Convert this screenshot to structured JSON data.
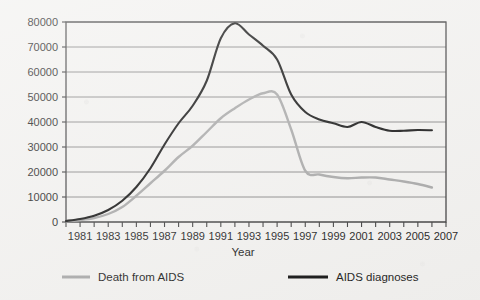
{
  "chart_data": {
    "type": "line",
    "title": "",
    "subtitle": "",
    "xlabel": "Year",
    "ylabel": "",
    "xlim": [
      1980,
      2007
    ],
    "ylim": [
      0,
      80000
    ],
    "grid": "horizontal",
    "legend_position": "bottom",
    "y_ticks": [
      0,
      10000,
      20000,
      30000,
      40000,
      50000,
      60000,
      70000,
      80000
    ],
    "y_tick_labels": [
      "0",
      "10000",
      "20000",
      "30000",
      "40000",
      "50000",
      "60000",
      "70000",
      "80000"
    ],
    "x_ticks": [
      1980,
      1981,
      1982,
      1983,
      1984,
      1985,
      1986,
      1987,
      1988,
      1989,
      1990,
      1991,
      1992,
      1993,
      1994,
      1995,
      1996,
      1997,
      1998,
      1999,
      2000,
      2001,
      2002,
      2003,
      2004,
      2005,
      2006,
      2007
    ],
    "x_tick_labels": [
      "1981",
      "1983",
      "1985",
      "1987",
      "1989",
      "1991",
      "1993",
      "1995",
      "1997",
      "1999",
      "2001",
      "2003",
      "2005",
      "2007"
    ],
    "x_labeled_years": [
      1981,
      1983,
      1985,
      1987,
      1989,
      1991,
      1993,
      1995,
      1997,
      1999,
      2001,
      2003,
      2005,
      2007
    ],
    "x": [
      1980,
      1981,
      1982,
      1983,
      1984,
      1985,
      1986,
      1987,
      1988,
      1989,
      1990,
      1991,
      1992,
      1993,
      1994,
      1995,
      1996,
      1997,
      1998,
      1999,
      2000,
      2001,
      2002,
      2003,
      2004,
      2005,
      2006
    ],
    "series": [
      {
        "name": "AIDS diagnoses",
        "color": "#111111",
        "values": [
          400,
          1200,
          2500,
          4800,
          8500,
          14000,
          21500,
          31000,
          39500,
          46500,
          56500,
          73500,
          79500,
          75000,
          70500,
          65000,
          51000,
          44000,
          41000,
          39500,
          38000,
          40000,
          38000,
          36500,
          36500,
          36800,
          36700
        ]
      },
      {
        "name": "Death from AIDS",
        "color": "#a6a6a6",
        "values": [
          300,
          800,
          1600,
          3200,
          6000,
          10500,
          15500,
          20500,
          26000,
          30500,
          36000,
          41500,
          45500,
          49000,
          51500,
          51000,
          37000,
          20500,
          19000,
          18000,
          17500,
          17800,
          17800,
          17000,
          16200,
          15200,
          13800
        ]
      }
    ],
    "legend": [
      {
        "label": "Death from AIDS",
        "color": "#a6a6a6"
      },
      {
        "label": "AIDS diagnoses",
        "color": "#111111"
      }
    ]
  },
  "axis": {
    "x_title": "Year"
  },
  "colors": {
    "background": "#f2f1ef",
    "grid": "#7a7a7a",
    "frame": "#3d3d3d",
    "text": "#1a1a1a",
    "series_black": "#111111",
    "series_gray": "#a6a6a6"
  }
}
